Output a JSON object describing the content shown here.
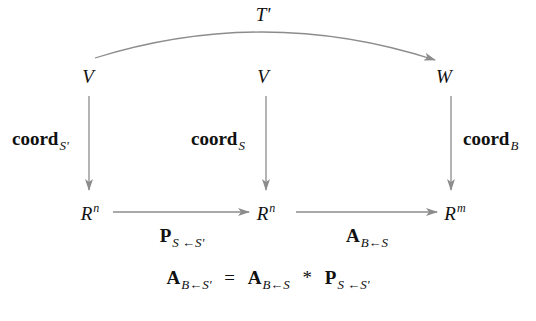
{
  "diagram": {
    "top_map": {
      "label": "T'"
    },
    "top_row": [
      {
        "id": "V1",
        "label": "V"
      },
      {
        "id": "V2",
        "label": "V"
      },
      {
        "id": "W",
        "label": "W"
      }
    ],
    "bottom_row": [
      {
        "id": "R1",
        "base": "R",
        "exp": "n"
      },
      {
        "id": "R2",
        "base": "R",
        "exp": "n"
      },
      {
        "id": "R3",
        "base": "R",
        "exp": "m"
      }
    ],
    "vertical_maps": [
      {
        "name": "coord",
        "sub": "S'"
      },
      {
        "name": "coord",
        "sub": "S"
      },
      {
        "name": "coord",
        "sub": "B"
      }
    ],
    "horizontal_maps": [
      {
        "name": "P",
        "sub": "S ←S'"
      },
      {
        "name": "A",
        "sub": "B←S"
      }
    ],
    "equation": {
      "lhs": {
        "name": "A",
        "sub": "B←S'"
      },
      "equals": "=",
      "term1": {
        "name": "A",
        "sub": "B←S"
      },
      "times": "*",
      "term2": {
        "name": "P",
        "sub": "S ←S'"
      }
    },
    "colors": {
      "arrow": "#8c8c8c",
      "text": "#111111",
      "background": "#ffffff"
    }
  }
}
